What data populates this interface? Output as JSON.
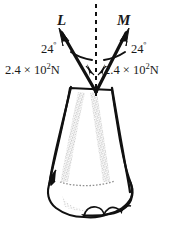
{
  "figure": {
    "background_color": "#ffffff",
    "ink_color": "#1a1a1a",
    "shading_color": "#9a9a9a"
  },
  "vectors": [
    {
      "name": "L",
      "label": "L",
      "side": "left",
      "angle_from_vertical_deg": 24,
      "angle_label": "24",
      "degree_symbol": "º",
      "magnitude_label": "2.4 × 10",
      "magnitude_exponent": "2",
      "magnitude_unit": "N"
    },
    {
      "name": "M",
      "label": "M",
      "side": "right",
      "angle_from_vertical_deg": 24,
      "angle_label": "24",
      "degree_symbol": "º",
      "magnitude_label": "2.4 × 10",
      "magnitude_exponent": "2",
      "magnitude_unit": "N"
    }
  ],
  "reference_line": {
    "name": "vertical-axis",
    "style": "dashed",
    "orientation": "vertical"
  },
  "anatomy": {
    "shaft_label": "bone-shaft",
    "condyle_label": "bone-condyle"
  }
}
